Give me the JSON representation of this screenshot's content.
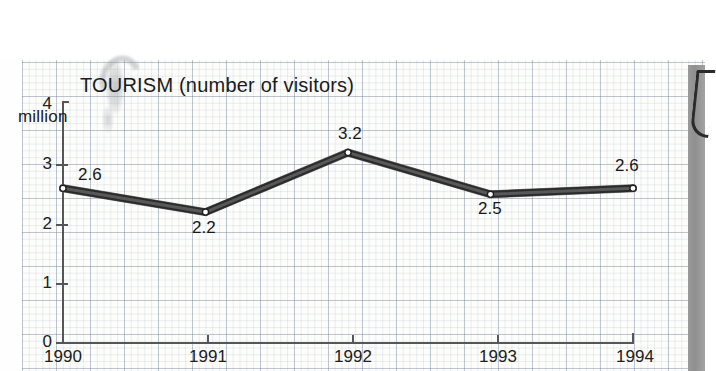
{
  "chart_data": {
    "type": "line",
    "title": "TOURISM (number of visitors)",
    "xlabel": "",
    "ylabel": "million",
    "categories": [
      "1990",
      "1991",
      "1992",
      "1993",
      "1994"
    ],
    "values": [
      2.6,
      2.2,
      3.2,
      2.5,
      2.6
    ],
    "point_labels": [
      "2.6",
      "2.2",
      "3.2",
      "2.5",
      "2.6"
    ],
    "ylim": [
      0,
      4
    ],
    "yticks": [
      "0",
      "1",
      "2",
      "3",
      "4"
    ],
    "grid": true,
    "legend": "none",
    "series": [
      {
        "name": "visitors",
        "values": [
          2.6,
          2.2,
          3.2,
          2.5,
          2.6
        ]
      }
    ]
  },
  "axes": {
    "y_unit_caption": "million",
    "y_ticks": [
      {
        "label": "4",
        "value": 4
      },
      {
        "label": "3",
        "value": 3
      },
      {
        "label": "2",
        "value": 2
      },
      {
        "label": "1",
        "value": 1
      },
      {
        "label": "0",
        "value": 0
      }
    ],
    "x_ticks": [
      {
        "label": "1990"
      },
      {
        "label": "1991"
      },
      {
        "label": "1992"
      },
      {
        "label": "1993"
      },
      {
        "label": "1994"
      }
    ]
  },
  "colors": {
    "line": "#2b2b2b",
    "line_highlight": "#5d5d5d",
    "marker_fill": "#ffffff",
    "axis": "#55565a",
    "grid_major": "#7887a0",
    "grid_minor": "#8c9baf",
    "text": "#1b1b1b",
    "page_edge": "#9a9a9a"
  }
}
